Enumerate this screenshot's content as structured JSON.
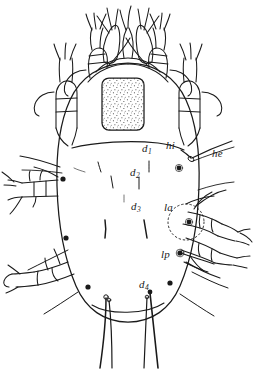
{
  "figure": {
    "view": "dorsal",
    "background_color": "#ffffff",
    "ink_color": "#1a1a1a",
    "stipple_color": "#3a3a3a",
    "canvas": {
      "width": 256,
      "height": 372
    }
  },
  "labels": [
    {
      "id": "d1",
      "text": "d",
      "subscript": "1",
      "x": 142,
      "y": 148,
      "leader": true,
      "meaning": "dorsal seta 1"
    },
    {
      "id": "d2",
      "text": "d",
      "subscript": "2",
      "x": 133,
      "y": 172,
      "leader": true,
      "meaning": "dorsal seta 2"
    },
    {
      "id": "d3",
      "text": "d",
      "subscript": "3",
      "x": 133,
      "y": 206,
      "leader": true,
      "meaning": "dorsal seta 3"
    },
    {
      "id": "d4",
      "text": "d",
      "subscript": "4",
      "x": 141,
      "y": 284,
      "leader": true,
      "meaning": "dorsal seta 4"
    },
    {
      "id": "hi",
      "text": "hi",
      "subscript": "",
      "x": 168,
      "y": 144,
      "leader": true,
      "meaning": "humeral internal seta"
    },
    {
      "id": "he",
      "text": "he",
      "subscript": "",
      "x": 214,
      "y": 152,
      "leader": true,
      "meaning": "humeral external seta"
    },
    {
      "id": "la",
      "text": "la",
      "subscript": "",
      "x": 166,
      "y": 206,
      "leader": true,
      "meaning": "lateral anterior seta"
    },
    {
      "id": "lp",
      "text": "lp",
      "subscript": "",
      "x": 163,
      "y": 253,
      "leader": true,
      "meaning": "lateral posterior seta"
    }
  ],
  "structures": {
    "idiosoma": "ovoid body outline",
    "propodosomal_shield": "stippled rounded rectangle on anterior dorsum",
    "sejugal_furrow": "transverse line separating propodosoma and hysterosoma",
    "legs": [
      "leg I",
      "leg II",
      "leg III",
      "leg IV"
    ],
    "gnathosoma": "chelicerae and palps at anterior end",
    "lateral_gland_opening": "dotted oval with dark pore at la position"
  }
}
